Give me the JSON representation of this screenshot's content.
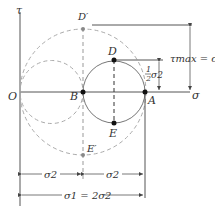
{
  "diagram": {
    "axes": {
      "vertical": "τ",
      "horizontal": "σ",
      "origin": "O"
    },
    "points": {
      "O": "O",
      "B": "B",
      "A": "A",
      "D": "D",
      "E": "E",
      "D_prime": "D′",
      "E_prime": "E′"
    },
    "annotations": {
      "tau_max": "τmax = σ2",
      "half_sigma_num": "1",
      "half_sigma_den": "2",
      "half_sigma_sym": "σ2",
      "dim_left": "σ2",
      "dim_right": "σ2",
      "dim_total": "σ1 = 2σ2"
    },
    "colors": {
      "line": "#555555",
      "dashed": "#aaaaaa",
      "point": "#111111"
    }
  }
}
